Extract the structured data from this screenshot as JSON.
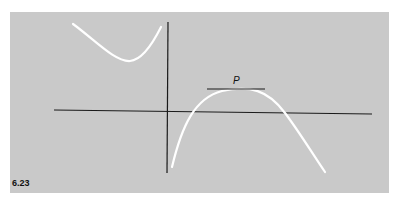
{
  "figure": {
    "number": "6.23",
    "point_label": "P",
    "colors": {
      "background": "#c9c9c9",
      "axes": "#1a1a1a",
      "curve": "#ffffff",
      "tangent": "#1a1a1a"
    },
    "elements": {
      "axes": "x-axis and y-axis",
      "left_branch": "upper-left curve with local minimum",
      "right_branch": "lower-right curve rising to local maximum at P then descending",
      "tangent": "horizontal tangent line at P"
    }
  }
}
